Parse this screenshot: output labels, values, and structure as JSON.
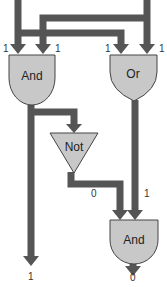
{
  "colors": {
    "wire": "#555555",
    "gate_fill": "#c8c8c8",
    "gate_stroke": "#444444",
    "text": "#222222"
  },
  "gates": {
    "and_top": {
      "label": "And",
      "inputs": [
        "1",
        "1"
      ]
    },
    "or_top": {
      "label": "Or",
      "inputs": [
        "1",
        "1"
      ]
    },
    "not_mid": {
      "label": "Not"
    },
    "and_bottom": {
      "label": "And",
      "inputs": [
        "0",
        "1"
      ]
    }
  },
  "outputs": {
    "left": "1",
    "right": "0"
  }
}
